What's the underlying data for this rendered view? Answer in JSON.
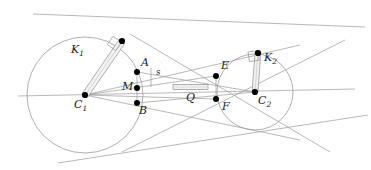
{
  "figure": {
    "type": "geometry-diagram",
    "background_color": "#ffffff",
    "stroke_color": "#8f8f8f",
    "point_color": "#000000",
    "label_color": "#1a1a1a"
  },
  "labels": {
    "k1": "K",
    "k1_sub": "1",
    "k2": "K",
    "k2_sub": "2",
    "c1": "C",
    "c1_sub": "1",
    "c2": "C",
    "c2_sub": "2",
    "a": "A",
    "b": "B",
    "m": "M",
    "e": "E",
    "f": "F",
    "q": "Q",
    "s": "s"
  },
  "geometry": {
    "circle1": {
      "cx": 85,
      "cy": 95,
      "r": 58
    },
    "circle2": {
      "cx": 255,
      "cy": 92,
      "r": 38
    },
    "points": {
      "C1": {
        "x": 85,
        "y": 95
      },
      "C2": {
        "x": 255,
        "y": 92
      },
      "A": {
        "x": 137,
        "y": 72
      },
      "M": {
        "x": 137,
        "y": 88
      },
      "B": {
        "x": 137,
        "y": 103
      },
      "E": {
        "x": 216,
        "y": 76
      },
      "F": {
        "x": 216,
        "y": 99
      },
      "T1": {
        "x": 122,
        "y": 41
      },
      "T2": {
        "x": 258,
        "y": 54
      }
    },
    "segment_q": {
      "x1": 173,
      "y1": 87,
      "x2": 208,
      "y2": 87,
      "thickness": 5
    }
  }
}
